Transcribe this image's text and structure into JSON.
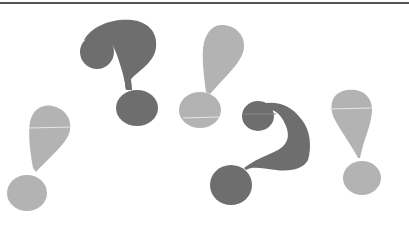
{
  "illustration": {
    "description": "Scattered question marks and exclamation marks",
    "background": "#ffffff",
    "rule_color": "#555555",
    "colors": {
      "question_mark": "#6e6e6e",
      "exclamation_mark": "#b3b3b3",
      "streak": "#e6e6e6"
    },
    "glyphs": [
      {
        "type": "exclamation-mark",
        "shade": "light",
        "position": "left-bottom"
      },
      {
        "type": "question-mark",
        "shade": "dark",
        "position": "upper-left-center"
      },
      {
        "type": "exclamation-mark",
        "shade": "light",
        "position": "upper-center"
      },
      {
        "type": "question-mark",
        "shade": "dark",
        "position": "lower-right-center"
      },
      {
        "type": "exclamation-mark",
        "shade": "light",
        "position": "right"
      }
    ]
  }
}
